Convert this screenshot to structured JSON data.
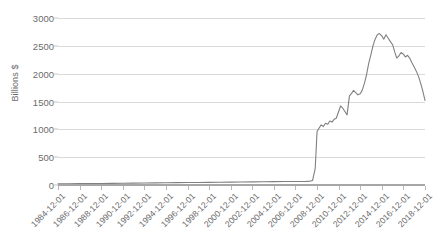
{
  "chart_data": {
    "type": "line",
    "title": "",
    "xlabel": "",
    "ylabel": "Billions $",
    "ylim": [
      0,
      3000
    ],
    "ytick_labels": [
      "3000",
      "2500",
      "2000",
      "1500",
      "1000",
      "500",
      "0"
    ],
    "ytick_values": [
      3000,
      2500,
      2000,
      1500,
      1000,
      500,
      0
    ],
    "grid": true,
    "legend": "none",
    "line_color": "#808080",
    "xtick_labels": [
      "1984-12-01",
      "1986-12-01",
      "1988-12-01",
      "1990-12-01",
      "1992-12-01",
      "1994-12-01",
      "1996-12-01",
      "1998-12-01",
      "2000-12-01",
      "2002-12-01",
      "2004-12-01",
      "2006-12-01",
      "2008-12-01",
      "2010-12-01",
      "2012-12-01",
      "2014-12-01",
      "2016-12-01",
      "2018-12-01"
    ],
    "x": [
      1984.92,
      1985.92,
      1986.92,
      1987.92,
      1988.92,
      1989.92,
      1990.92,
      1991.92,
      1992.92,
      1993.92,
      1994.92,
      1995.92,
      1996.92,
      1997.92,
      1998.92,
      1999.92,
      2000.92,
      2001.92,
      2002.92,
      2003.92,
      2004.92,
      2005.92,
      2006.92,
      2007.92,
      2008.25,
      2008.5,
      2008.75,
      2008.92,
      2009.1,
      2009.3,
      2009.5,
      2009.7,
      2009.92,
      2010.1,
      2010.3,
      2010.5,
      2010.7,
      2010.92,
      2011.1,
      2011.3,
      2011.5,
      2011.7,
      2011.92,
      2012.1,
      2012.3,
      2012.5,
      2012.7,
      2012.92,
      2013.1,
      2013.3,
      2013.5,
      2013.7,
      2013.92,
      2014.1,
      2014.3,
      2014.5,
      2014.7,
      2014.92,
      2015.1,
      2015.3,
      2015.5,
      2015.7,
      2015.92,
      2016.1,
      2016.3,
      2016.5,
      2016.7,
      2016.92,
      2017.1,
      2017.3,
      2017.5,
      2017.7,
      2017.92,
      2018.1,
      2018.3,
      2018.5,
      2018.7,
      2018.92
    ],
    "values": [
      20,
      22,
      24,
      26,
      28,
      30,
      32,
      34,
      36,
      38,
      40,
      42,
      44,
      46,
      48,
      50,
      52,
      54,
      56,
      58,
      60,
      62,
      64,
      66,
      70,
      80,
      300,
      960,
      1020,
      1080,
      1050,
      1110,
      1090,
      1150,
      1130,
      1180,
      1200,
      1320,
      1420,
      1380,
      1320,
      1260,
      1600,
      1640,
      1700,
      1660,
      1620,
      1640,
      1700,
      1820,
      1980,
      2180,
      2350,
      2500,
      2620,
      2700,
      2720,
      2680,
      2620,
      2700,
      2640,
      2580,
      2520,
      2400,
      2280,
      2320,
      2380,
      2350,
      2300,
      2330,
      2280,
      2200,
      2120,
      2050,
      1960,
      1840,
      1700,
      1520
    ]
  }
}
